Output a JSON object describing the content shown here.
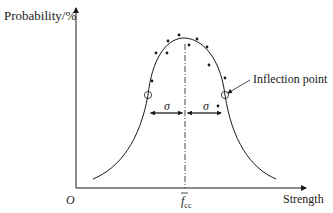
{
  "diagram": {
    "type": "normal-distribution-curve",
    "y_axis_label": "Probability/%",
    "x_axis_label": "Strength",
    "origin_label": "O",
    "mean_label": "f",
    "mean_subscript": "cc",
    "sigma_left_label": "σ",
    "sigma_right_label": "σ",
    "annotation": "Inflection point",
    "colors": {
      "line": "#1a1a1a",
      "background": "#ffffff"
    },
    "data_points_count": 14
  }
}
